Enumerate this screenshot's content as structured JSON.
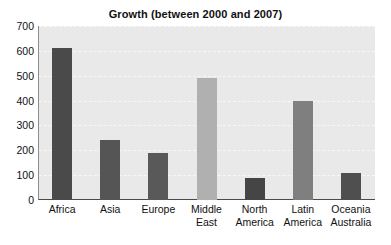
{
  "chart_data": {
    "type": "bar",
    "title": "Growth (between 2000 and 2007)",
    "xlabel": "",
    "ylabel": "",
    "categories": [
      "Africa",
      "Asia",
      "Europe",
      "Middle East",
      "North America",
      "Latin America",
      "Oceania Australia"
    ],
    "values": [
      610,
      240,
      190,
      490,
      90,
      400,
      110
    ],
    "bar_colors": [
      "#4a4a4a",
      "#555555",
      "#595959",
      "#b0b0b0",
      "#454545",
      "#7f7f7f",
      "#4f4f4f"
    ],
    "ylim": [
      0,
      700
    ],
    "ytick_values": [
      700,
      600,
      500,
      400,
      300,
      200,
      100,
      0
    ],
    "ytick_labels": [
      "700",
      "600",
      "500",
      "400",
      "300",
      "200",
      "100",
      "0"
    ],
    "grid": true,
    "grid_axis": "y",
    "legend": false,
    "legend_position": "none",
    "plot_background": "#e9e9e9",
    "figure_background": "#ffffff"
  },
  "axis": {
    "x_tick_labels": [
      "Africa",
      "Asia",
      "Europe",
      "Middle\nEast",
      "North\nAmerica",
      "Latin\nAmerica",
      "Oceania\nAustralia"
    ]
  }
}
